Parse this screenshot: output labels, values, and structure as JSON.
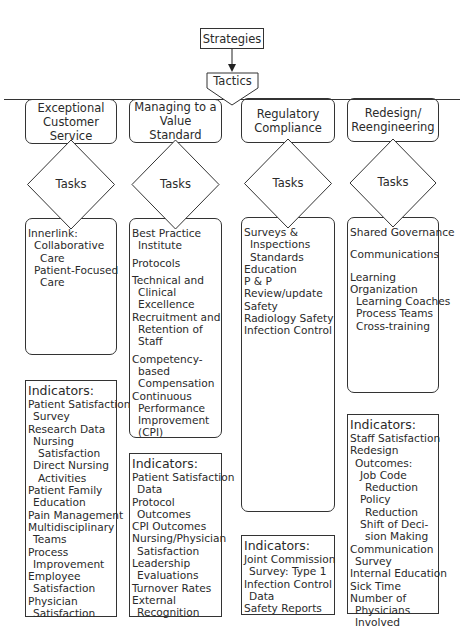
{
  "top": {
    "strategies_label": "Strategies",
    "tactics_label": "Tactics"
  },
  "columns": [
    {
      "header": [
        "Exceptional",
        "Customer Service"
      ],
      "diamond_label": "Tasks",
      "tasks": [
        {
          "text": "Innerlink:",
          "indent": 0
        },
        {
          "text": "Collaborative",
          "indent": 1
        },
        {
          "text": "Care",
          "indent": 2
        },
        {
          "text": "Patient-Focused",
          "indent": 1
        },
        {
          "text": "Care",
          "indent": 2
        }
      ],
      "indicators_title": "Indicators:",
      "indicators": [
        {
          "text": "Patient Satisfaction",
          "indent": 0
        },
        {
          "text": "Survey",
          "indent": 1
        },
        {
          "text": "Research Data",
          "indent": 0
        },
        {
          "text": "Nursing",
          "indent": 1
        },
        {
          "text": "Satisfaction",
          "indent": 2
        },
        {
          "text": "Direct Nursing",
          "indent": 1
        },
        {
          "text": "Activities",
          "indent": 2
        },
        {
          "text": "Patient Family",
          "indent": 0
        },
        {
          "text": "Education",
          "indent": 1
        },
        {
          "text": "Pain Management",
          "indent": 0
        },
        {
          "text": "Multidisciplinary",
          "indent": 0
        },
        {
          "text": "Teams",
          "indent": 1
        },
        {
          "text": "Process",
          "indent": 0
        },
        {
          "text": "Improvement",
          "indent": 1
        },
        {
          "text": "Employee",
          "indent": 0
        },
        {
          "text": "Satisfaction",
          "indent": 1
        },
        {
          "text": "Physician",
          "indent": 0
        },
        {
          "text": "Satisfaction",
          "indent": 1
        }
      ]
    },
    {
      "header": [
        "Managing to a",
        "Value Standard"
      ],
      "diamond_label": "Tasks",
      "tasks": [
        {
          "text": "Best Practice",
          "indent": 0
        },
        {
          "text": "Institute",
          "indent": 1
        },
        {
          "text": "Protocols",
          "indent": 0,
          "gap": true
        },
        {
          "text": "Technical and",
          "indent": 0,
          "gap": true
        },
        {
          "text": "Clinical",
          "indent": 1
        },
        {
          "text": "Excellence",
          "indent": 1
        },
        {
          "text": "Recruitment and",
          "indent": 0
        },
        {
          "text": "Retention of",
          "indent": 1
        },
        {
          "text": "Staff",
          "indent": 1
        },
        {
          "text": "Competency-",
          "indent": 0,
          "gap": true
        },
        {
          "text": "based",
          "indent": 1
        },
        {
          "text": "Compensation",
          "indent": 1
        },
        {
          "text": "Continuous",
          "indent": 0
        },
        {
          "text": "Performance",
          "indent": 1
        },
        {
          "text": "Improvement",
          "indent": 1
        },
        {
          "text": "(CPI)",
          "indent": 1
        }
      ],
      "indicators_title": "Indicators:",
      "indicators": [
        {
          "text": "Patient Satisfaction",
          "indent": 0
        },
        {
          "text": "Data",
          "indent": 1
        },
        {
          "text": "Protocol",
          "indent": 0
        },
        {
          "text": "Outcomes",
          "indent": 1
        },
        {
          "text": "CPI Outcomes",
          "indent": 0
        },
        {
          "text": "Nursing/Physician",
          "indent": 0
        },
        {
          "text": "Satisfaction",
          "indent": 1
        },
        {
          "text": "Leadership",
          "indent": 0
        },
        {
          "text": "Evaluations",
          "indent": 1
        },
        {
          "text": "Turnover Rates",
          "indent": 0
        },
        {
          "text": "External",
          "indent": 0
        },
        {
          "text": "Recognition",
          "indent": 1
        }
      ]
    },
    {
      "header": [
        "Regulatory",
        "Compliance"
      ],
      "diamond_label": "Tasks",
      "tasks": [
        {
          "text": "Surveys &",
          "indent": 0
        },
        {
          "text": "Inspections",
          "indent": 1
        },
        {
          "text": "Standards",
          "indent": 1
        },
        {
          "text": "Education",
          "indent": 0
        },
        {
          "text": "P & P",
          "indent": 0
        },
        {
          "text": "Review/update",
          "indent": 0
        },
        {
          "text": "Safety",
          "indent": 0
        },
        {
          "text": "Radiology Safety",
          "indent": 0
        },
        {
          "text": "Infection Control",
          "indent": 0
        }
      ],
      "indicators_title": "Indicators:",
      "indicators": [
        {
          "text": "Joint Commission",
          "indent": 0
        },
        {
          "text": "Survey: Type 1",
          "indent": 1
        },
        {
          "text": "Infection Control",
          "indent": 0
        },
        {
          "text": "Data",
          "indent": 1
        },
        {
          "text": "Safety Reports",
          "indent": 0
        }
      ]
    },
    {
      "header": [
        "Redesign/",
        "Reengineering"
      ],
      "diamond_label": "Tasks",
      "tasks": [
        {
          "text": "Shared Governance",
          "indent": 0
        },
        {
          "text": "Communications",
          "indent": 0,
          "gap2": true
        },
        {
          "text": "Learning",
          "indent": 0,
          "gap2": true
        },
        {
          "text": "Organization",
          "indent": 0
        },
        {
          "text": "Learning Coaches",
          "indent": 1
        },
        {
          "text": "Process Teams",
          "indent": 1
        },
        {
          "text": "Cross-training",
          "indent": 1
        }
      ],
      "indicators_title": "Indicators:",
      "indicators": [
        {
          "text": "Staff Satisfaction",
          "indent": 0
        },
        {
          "text": "Redesign",
          "indent": 0
        },
        {
          "text": "Outcomes:",
          "indent": 1
        },
        {
          "text": "Job Code",
          "indent": 2
        },
        {
          "text": "Reduction",
          "indent": 3
        },
        {
          "text": "Policy",
          "indent": 2
        },
        {
          "text": "Reduction",
          "indent": 3
        },
        {
          "text": "Shift of Deci-",
          "indent": 2
        },
        {
          "text": "sion Making",
          "indent": 3
        },
        {
          "text": "Communication",
          "indent": 0
        },
        {
          "text": "Survey",
          "indent": 1
        },
        {
          "text": "Internal Education",
          "indent": 0
        },
        {
          "text": "Sick Time",
          "indent": 0
        },
        {
          "text": "Number of",
          "indent": 0
        },
        {
          "text": "Physicians",
          "indent": 1
        },
        {
          "text": "Involved",
          "indent": 1
        }
      ]
    }
  ]
}
